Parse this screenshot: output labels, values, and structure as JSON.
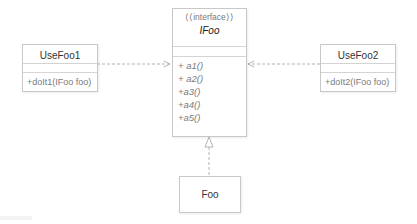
{
  "diagram": {
    "type": "uml-class-diagram",
    "colors": {
      "border": "#c8c8c8",
      "line": "#b4b4b4",
      "text_dark": "#333333",
      "text_muted": "#7a7a7a"
    },
    "interface": {
      "stereotype": "««interface»»",
      "stereotype_display": "⟨⟨interface⟩⟩",
      "name": "IFoo",
      "operations": [
        "+ a1()",
        "+ a2()",
        "+a3()",
        "+a4()",
        "+a5()"
      ]
    },
    "classes": [
      {
        "name": "UseFoo1",
        "operations": [
          "+doIt1(IFoo foo)"
        ]
      },
      {
        "name": "UseFoo2",
        "operations": [
          "+doIt2(IFoo foo)"
        ]
      },
      {
        "name": "Foo",
        "operations": []
      }
    ],
    "relations": [
      {
        "from": "UseFoo1",
        "to": "IFoo",
        "kind": "dependency",
        "style": "dashed-open-arrow"
      },
      {
        "from": "UseFoo2",
        "to": "IFoo",
        "kind": "dependency",
        "style": "dashed-open-arrow"
      },
      {
        "from": "Foo",
        "to": "IFoo",
        "kind": "realization",
        "style": "dashed-hollow-triangle"
      }
    ]
  }
}
